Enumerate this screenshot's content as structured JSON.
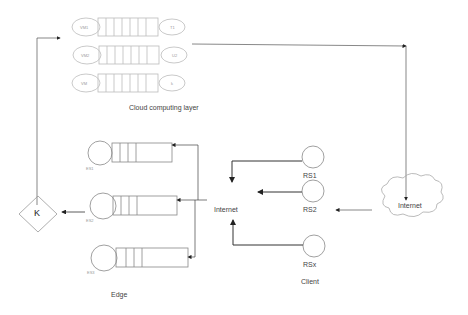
{
  "cloud_layer": {
    "title": "Cloud computing layer",
    "vms": [
      {
        "left": "VM1",
        "right": "T1"
      },
      {
        "left": "VM2",
        "right": "U2"
      },
      {
        "left": "VM",
        "right": "k"
      }
    ]
  },
  "edge_layer": {
    "title": "Edge",
    "servers": [
      "ES1",
      "ES2",
      "ES3"
    ],
    "decision_symbol": "K"
  },
  "client_layer": {
    "title": "Client",
    "internet_label": "Internet",
    "nodes": [
      "RS1",
      "RS2",
      "RSx"
    ]
  },
  "internet_cloud": {
    "label": "Internet"
  }
}
